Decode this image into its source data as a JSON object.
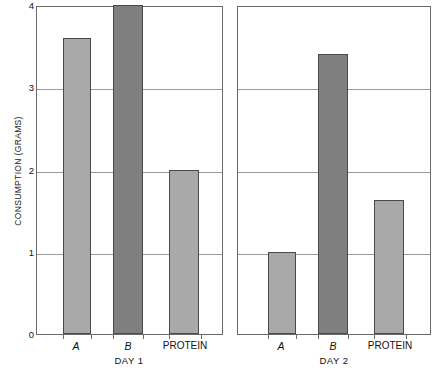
{
  "chart_data": {
    "type": "bar",
    "title": "",
    "xlabel": "",
    "ylabel": "CONSUMPTION (GRAMS)",
    "ylim": [
      0,
      4
    ],
    "yticks": [
      0,
      1,
      2,
      3,
      4
    ],
    "ytick_labels": [
      "0",
      "1",
      "2",
      "3",
      "4"
    ],
    "grid": true,
    "grid_axis": "y",
    "legend": "none",
    "panels": [
      {
        "name": "DAY 1",
        "categories": [
          "A",
          "B",
          "PROTEIN"
        ],
        "values": [
          3.6,
          4.0,
          2.0
        ],
        "colors": [
          "#a9a9a9",
          "#7f7f7f",
          "#a9a9a9"
        ]
      },
      {
        "name": "DAY 2",
        "categories": [
          "A",
          "B",
          "PROTEIN"
        ],
        "values": [
          1.0,
          3.4,
          1.63
        ],
        "colors": [
          "#a9a9a9",
          "#7f7f7f",
          "#a9a9a9"
        ]
      }
    ]
  },
  "axis": {
    "y_label": "CONSUMPTION (GRAMS)",
    "tick_4": "4",
    "tick_3": "3",
    "tick_2": "2",
    "tick_1": "1",
    "tick_0": "0"
  },
  "panel1": {
    "title": "DAY 1",
    "cat_a": "A",
    "cat_b": "B",
    "cat_protein": "PROTEIN"
  },
  "panel2": {
    "title": "DAY 2",
    "cat_a": "A",
    "cat_b": "B",
    "cat_protein": "PROTEIN"
  },
  "colors": {
    "bar_light": "#a9a9a9",
    "bar_dark": "#7f7f7f",
    "bar_edge": "#4a4a4a",
    "frame": "#6a6a6a",
    "grid": "#9a9a9a",
    "background": "#ffffff"
  }
}
